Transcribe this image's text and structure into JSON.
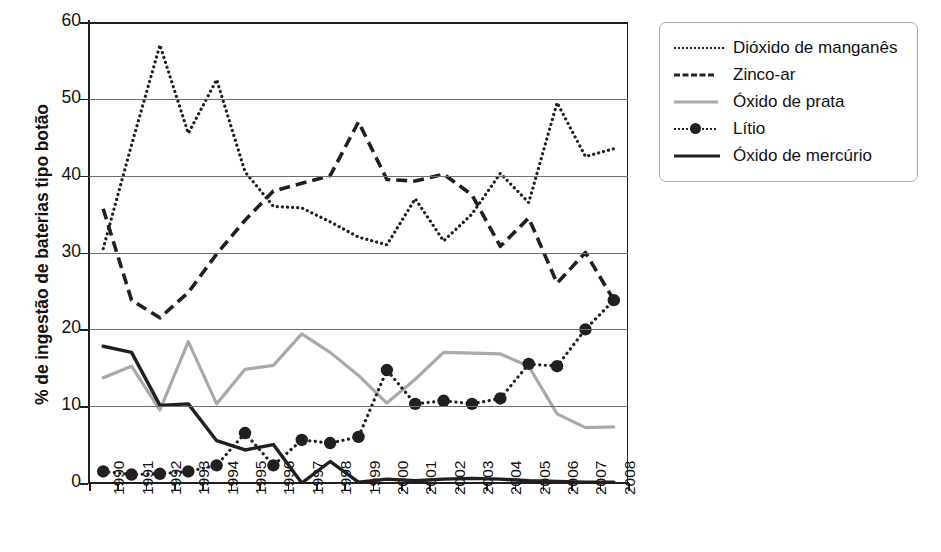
{
  "chart_data": {
    "type": "line",
    "title": "",
    "xlabel": "",
    "ylabel": "% de ingestão de baterias tipo botão",
    "ylim": [
      0,
      60
    ],
    "yticks": [
      0,
      10,
      20,
      30,
      40,
      50,
      60
    ],
    "grid": true,
    "legend_position": "right",
    "categories": [
      "1990",
      "1991",
      "1992",
      "1993",
      "1994",
      "1995",
      "1996",
      "1997",
      "1998",
      "1999",
      "2000",
      "2001",
      "2002",
      "2003",
      "2004",
      "2005",
      "2006",
      "2007",
      "2008"
    ],
    "series": [
      {
        "name": "Dióxido de manganês",
        "style": "dotted",
        "color": "#231f20",
        "values": [
          30.5,
          44.0,
          57.0,
          45.5,
          52.5,
          40.5,
          36.0,
          35.8,
          34.0,
          32.0,
          31.0,
          37.0,
          31.5,
          35.0,
          40.3,
          36.5,
          49.5,
          42.5,
          43.5
        ]
      },
      {
        "name": "Zinco-ar",
        "style": "dashed",
        "color": "#231f20",
        "values": [
          35.7,
          23.8,
          21.5,
          24.8,
          29.8,
          34.2,
          38.0,
          39.0,
          40.0,
          47.0,
          39.5,
          39.3,
          40.2,
          37.5,
          30.8,
          34.5,
          26.0,
          30.0,
          23.8
        ]
      },
      {
        "name": "Óxido de prata",
        "style": "solid",
        "color": "#a7a9ac",
        "values": [
          13.7,
          15.2,
          9.5,
          18.4,
          10.3,
          14.8,
          15.3,
          19.4,
          17.0,
          14.0,
          10.4,
          13.5,
          17.0,
          16.9,
          16.8,
          15.2,
          9.0,
          7.2,
          7.3
        ]
      },
      {
        "name": "Lítio",
        "style": "dotted-marker",
        "color": "#231f20",
        "values": [
          1.5,
          1.1,
          1.2,
          1.5,
          2.3,
          6.5,
          2.3,
          5.6,
          5.2,
          6.0,
          14.7,
          10.3,
          10.7,
          10.3,
          11.0,
          15.5,
          15.2,
          20.0,
          23.8
        ]
      },
      {
        "name": "Óxido de mercúrio",
        "style": "solid",
        "color": "#231f20",
        "values": [
          17.8,
          17.0,
          10.1,
          10.3,
          5.5,
          4.3,
          5.0,
          0.0,
          2.8,
          0.1,
          0.5,
          0.3,
          0.5,
          0.6,
          0.5,
          0.3,
          0.2,
          0.1,
          0.1
        ]
      }
    ]
  },
  "legend": {
    "items": [
      {
        "label": "Dióxido de manganês"
      },
      {
        "label": "Zinco-ar"
      },
      {
        "label": "Óxido de prata"
      },
      {
        "label": "Lítio"
      },
      {
        "label": "Óxido de mercúrio"
      }
    ]
  }
}
